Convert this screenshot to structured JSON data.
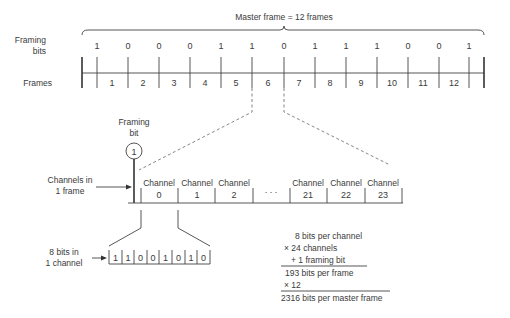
{
  "master_frame": {
    "title": "Master frame = 12 frames",
    "framing_bits_label_1": "Framing",
    "framing_bits_label_2": "bits",
    "frames_label": "Frames",
    "framing_bits": [
      "1",
      "0",
      "0",
      "0",
      "1",
      "1",
      "0",
      "1",
      "1",
      "1",
      "0",
      "0",
      "1"
    ],
    "frames": [
      "1",
      "2",
      "3",
      "4",
      "5",
      "6",
      "7",
      "8",
      "9",
      "10",
      "11",
      "12"
    ]
  },
  "frame_detail": {
    "framing_bit_label_1": "Framing",
    "framing_bit_label_2": "bit",
    "framing_bit_value": "1",
    "channels_label_1": "Channels in",
    "channels_label_2": "1 frame",
    "channel_word": "Channel",
    "channels": [
      "0",
      "1",
      "2",
      "21",
      "22",
      "23"
    ],
    "ellipsis": ". . ."
  },
  "channel_detail": {
    "label_1": "8 bits in",
    "label_2": "1 channel",
    "bits": [
      "1",
      "1",
      "0",
      "0",
      "1",
      "0",
      "1",
      "0"
    ]
  },
  "calculation": {
    "line1": "8 bits per channel",
    "line2": "× 24 channels",
    "line3": "+ 1 framing bit",
    "line4": "193 bits per frame",
    "line5": "× 12",
    "line6": "2316 bits per master frame"
  }
}
